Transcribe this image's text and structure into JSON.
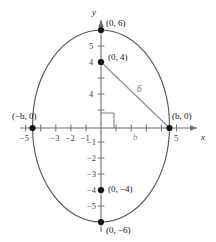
{
  "figure": {
    "type": "coordinate-plane-ellipse-diagram",
    "axes": {
      "x_axis_name": "x",
      "y_axis_name": "y",
      "x_ticks": [
        {
          "value": -5,
          "label": "−5"
        },
        {
          "value": -4,
          "label": ""
        },
        {
          "value": -3,
          "label": "−3"
        },
        {
          "value": -2,
          "label": "−2"
        },
        {
          "value": -1,
          "label": "−1"
        },
        {
          "value": 1,
          "label": ""
        },
        {
          "value": 2,
          "label": ""
        },
        {
          "value": 3,
          "label": ""
        },
        {
          "value": 4,
          "label": ""
        },
        {
          "value": 5,
          "label": "5"
        }
      ],
      "y_ticks": [
        {
          "value": 5,
          "label": "5"
        },
        {
          "value": 4,
          "label": "4"
        },
        {
          "value": 3,
          "label": ""
        },
        {
          "value": 2,
          "label": "4"
        },
        {
          "value": 1,
          "label": ""
        },
        {
          "value": -1,
          "label": "−1"
        },
        {
          "value": -2,
          "label": "−2"
        },
        {
          "value": -3,
          "label": "−3"
        },
        {
          "value": -4,
          "label": "−4"
        },
        {
          "value": -5,
          "label": "−5"
        }
      ],
      "x_range": [
        -5.9,
        6.0
      ],
      "y_range": [
        -6.6,
        6.6
      ]
    },
    "ellipse": {
      "center": [
        0,
        0
      ],
      "semi_axis_x": 4.6,
      "semi_axis_y": 6,
      "stroke_color": "#5a5a5a"
    },
    "points": [
      {
        "id": "top-vertex",
        "coords": [
          0,
          6
        ],
        "label": "(0, 6)"
      },
      {
        "id": "focus-upper",
        "coords": [
          0,
          4
        ],
        "label": "(0, 4)"
      },
      {
        "id": "left-vertex",
        "coords": [
          -4.6,
          0
        ],
        "label": "(−b, 0)"
      },
      {
        "id": "right-vertex",
        "coords": [
          4.6,
          0
        ],
        "label": "(b, 0)"
      },
      {
        "id": "focus-lower",
        "coords": [
          0,
          -4
        ],
        "label": "(0, −4)"
      },
      {
        "id": "bottom-vertex",
        "coords": [
          0,
          -6
        ],
        "label": "(0, −6)"
      }
    ],
    "segments": [
      {
        "id": "hypotenuse",
        "from": [
          0,
          4
        ],
        "to": [
          4.6,
          0
        ],
        "label": "6",
        "color": "#8a8a8a"
      }
    ],
    "axis_markers": [
      {
        "id": "b-horizontal",
        "label": "b",
        "position": [
          2.3,
          -0.55
        ]
      }
    ],
    "right_angle": {
      "at": [
        0,
        0
      ],
      "size": 1.0
    },
    "colors": {
      "ellipse": "#5a5a5a",
      "axis": "#6e6e6e",
      "point": "#111111",
      "segment": "#8a8a8a",
      "text": "#1a1a1a"
    }
  }
}
